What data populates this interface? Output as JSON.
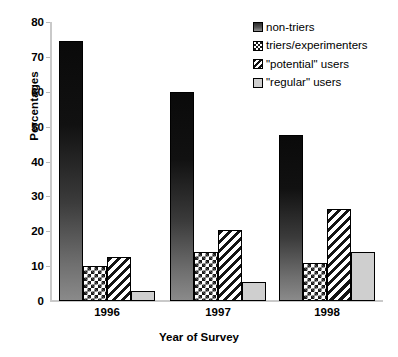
{
  "chart_data": {
    "type": "bar",
    "title": "",
    "subtitle": "",
    "xlabel": "Year of Survey",
    "ylabel": "Percentages",
    "categories": [
      "1996",
      "1997",
      "1998"
    ],
    "ylim": [
      0,
      80
    ],
    "yticks": [
      0,
      10,
      20,
      30,
      40,
      50,
      60,
      70,
      80
    ],
    "grid": false,
    "legend_position": "top-right",
    "series": [
      {
        "name": "non-triers",
        "pattern": "solid-gradient-dark",
        "values": [
          74.5,
          60,
          47.5
        ]
      },
      {
        "name": "triers/experimenters",
        "pattern": "checkerboard",
        "values": [
          10,
          14,
          11
        ]
      },
      {
        "name": "\"potential\" users",
        "pattern": "diagonal-stripes",
        "values": [
          12.5,
          20.5,
          26.5
        ]
      },
      {
        "name": "\"regular\" users",
        "pattern": "light-gray-solid",
        "values": [
          3,
          5.5,
          14
        ]
      }
    ],
    "annotations": []
  },
  "legend": {
    "items": [
      {
        "label": "non-triers"
      },
      {
        "label": "triers/experimenters"
      },
      {
        "label": "\"potential\" users"
      },
      {
        "label": "\"regular\" users"
      }
    ]
  },
  "axes": {
    "y_tick_labels": [
      "80",
      "70",
      "60",
      "50",
      "40",
      "30",
      "20",
      "10",
      "0"
    ],
    "x_tick_labels": [
      "1996",
      "1997",
      "1998"
    ]
  }
}
